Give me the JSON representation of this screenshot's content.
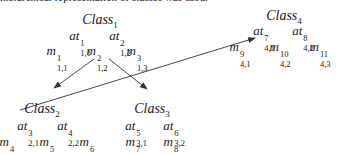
{
  "caption": "hierarchical representation of classes was used.",
  "classes": [
    {
      "id": "class1",
      "name": "Class",
      "index": "1",
      "attributes": [
        {
          "base": "at",
          "sup": "1",
          "sub": "1,1"
        },
        {
          "base": "at",
          "sup": "2",
          "sub": "1,2"
        }
      ],
      "methods": [
        {
          "base": "m",
          "sup": "1",
          "sub": "1,1"
        },
        {
          "base": "m",
          "sup": "2",
          "sub": "1,2"
        },
        {
          "base": "m",
          "sup": "3",
          "sub": "1,3"
        }
      ]
    },
    {
      "id": "class2",
      "name": "Class",
      "index": "2",
      "attributes": [
        {
          "base": "at",
          "sup": "3",
          "sub": "2,1"
        },
        {
          "base": "at",
          "sup": "4",
          "sub": "2,2"
        }
      ],
      "methods": [
        {
          "base": "m",
          "sup": "4",
          "sub": "2,1"
        },
        {
          "base": "m",
          "sup": "5",
          "sub": "2,2"
        },
        {
          "base": "m",
          "sup": "6",
          "sub": "2,3"
        }
      ]
    },
    {
      "id": "class3",
      "name": "Class",
      "index": "3",
      "attributes": [
        {
          "base": "at",
          "sup": "5",
          "sub": "3,1"
        },
        {
          "base": "at",
          "sup": "6",
          "sub": "3,2"
        }
      ],
      "methods": [
        {
          "base": "m",
          "sup": "7",
          "sub": "3,1"
        },
        {
          "base": "m",
          "sup": "8",
          "sub": "3,2"
        }
      ]
    },
    {
      "id": "class4",
      "name": "Class",
      "index": "4",
      "attributes": [
        {
          "base": "at",
          "sup": "7",
          "sub": "4,1"
        },
        {
          "base": "at",
          "sup": "8",
          "sub": "4,2"
        }
      ],
      "methods": [
        {
          "base": "m",
          "sup": "9",
          "sub": "4,1"
        },
        {
          "base": "m",
          "sup": "10",
          "sub": "4,2"
        },
        {
          "base": "m",
          "sup": "11",
          "sub": "4,3"
        }
      ]
    }
  ],
  "edges": [
    {
      "from": "m^2_{1,2}",
      "to": "Class_2"
    },
    {
      "from": "m^2_{1,2}",
      "to": "Class_3"
    },
    {
      "from": "Class_2",
      "to": "m^9_{4,1}"
    }
  ],
  "colors": {
    "line": "#333333",
    "text": "#1a1a1a",
    "background": "#ffffff"
  }
}
